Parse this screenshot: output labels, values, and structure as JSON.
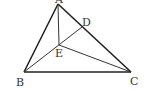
{
  "diagram": {
    "type": "triangle-geometry",
    "points": {
      "A": {
        "label": "A",
        "x": 58,
        "y": 4
      },
      "B": {
        "label": "B",
        "x": 24,
        "y": 72
      },
      "C": {
        "label": "C",
        "x": 131,
        "y": 72
      },
      "D": {
        "label": "D",
        "x": 82,
        "y": 27
      },
      "E": {
        "label": "E",
        "x": 59,
        "y": 45
      }
    },
    "segments": [
      {
        "from": "A",
        "to": "B",
        "weight": "thick"
      },
      {
        "from": "A",
        "to": "C",
        "weight": "thick"
      },
      {
        "from": "B",
        "to": "C",
        "weight": "thick"
      },
      {
        "from": "A",
        "to": "E",
        "weight": "thin"
      },
      {
        "from": "B",
        "to": "D",
        "weight": "thin"
      },
      {
        "from": "E",
        "to": "C",
        "weight": "thin"
      }
    ],
    "labels": {
      "A": "A",
      "B": "B",
      "C": "C",
      "D": "D",
      "E": "E"
    },
    "colors": {
      "stroke": "#222222",
      "label": "#333333"
    }
  }
}
